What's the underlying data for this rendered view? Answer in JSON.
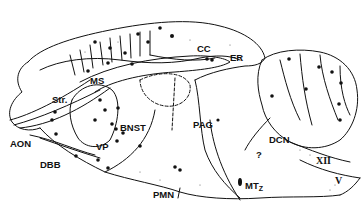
{
  "diagram": {
    "type": "sagittal brain section schematic",
    "line_color": "#111111",
    "background": "#ffffff",
    "labels": {
      "cc": "CC",
      "er": "ER",
      "ms": "MS",
      "str": "Str.",
      "bnst": "BNST",
      "aon": "AON",
      "vp": "VP",
      "dbb": "DBB",
      "pag": "PAG",
      "dcn": "DCN",
      "question": "?",
      "xii": "XII",
      "pmn": "PMN",
      "mtz_main": "MT",
      "mtz_sub": "Z",
      "v": "V"
    }
  }
}
